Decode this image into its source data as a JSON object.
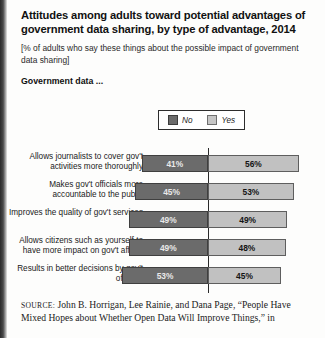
{
  "title": "Attitudes among adults toward potential advantages of government data sharing, by type of advantage, 2014",
  "subtitle": "[% of adults who say these things about the possible impact of government data sharing]",
  "group_label": "Government data ...",
  "legend": {
    "no_label": "No",
    "yes_label": "Yes"
  },
  "source": {
    "label": "SOURCE:",
    "text": "John B. Horrigan, Lee Rainie, and Dana Page, “People Have Mixed Hopes about Whether Open Data Will Improve Things,” in"
  },
  "colors": {
    "no": "#6b6b6b",
    "yes": "#c1c1c1",
    "axis": "#2a2a2a",
    "text": "#1a1a1a"
  },
  "chart_data": {
    "type": "bar",
    "orientation": "horizontal",
    "layout": "diverging-stacked",
    "title": "Attitudes among adults toward potential advantages of government data sharing, by type of advantage, 2014",
    "subtitle": "[% of adults who say these things about the possible impact of government data sharing]",
    "xlabel": "",
    "ylabel": "",
    "grid": false,
    "legend_position": "top-right",
    "center_at": 0,
    "categories": [
      "Allows journalists to cover gov't activities more thoroughly",
      "Makes gov't officials more accountable to the public",
      "Improves the quality of gov't services",
      "Allows citizens such as yourself to have more impact on gov't affairs",
      "Results in better decisions by gov't officials"
    ],
    "series": [
      {
        "name": "No",
        "values": [
          41,
          45,
          49,
          49,
          53
        ],
        "color": "#6b6b6b",
        "side": "left"
      },
      {
        "name": "Yes",
        "values": [
          56,
          53,
          49,
          48,
          45
        ],
        "color": "#c1c1c1",
        "side": "right"
      }
    ],
    "value_labels": [
      {
        "category_index": 0,
        "no": "41%",
        "yes": "56%"
      },
      {
        "category_index": 1,
        "no": "45%",
        "yes": "53%"
      },
      {
        "category_index": 2,
        "no": "49%",
        "yes": "49%"
      },
      {
        "category_index": 3,
        "no": "49%",
        "yes": "48%"
      },
      {
        "category_index": 4,
        "no": "53%",
        "yes": "45%"
      }
    ]
  }
}
